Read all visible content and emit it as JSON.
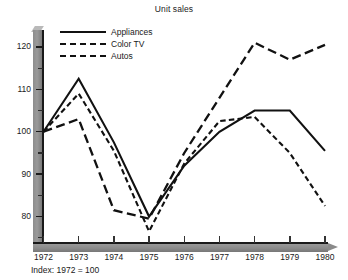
{
  "chart_data": {
    "type": "line",
    "title": "Unit sales",
    "footnote": "Index: 1972 = 100",
    "xlabel": "",
    "ylabel": "",
    "categories": [
      "1972",
      "1973",
      "1974",
      "1975",
      "1976",
      "1977",
      "1978",
      "1979",
      "1980"
    ],
    "x": [
      1972,
      1973,
      1974,
      1975,
      1976,
      1977,
      1978,
      1979,
      1980
    ],
    "ylim": [
      74,
      124
    ],
    "yticks_major": [
      80,
      90,
      100,
      110,
      120
    ],
    "yticks_minor": [
      75,
      85,
      95,
      105,
      115
    ],
    "ytick_labels": [
      "80",
      "90",
      "100",
      "110",
      "120"
    ],
    "grid": false,
    "legend_position": "top-left",
    "series": [
      {
        "name": "Appliances",
        "style": "solid",
        "values": [
          100,
          112.5,
          97.5,
          80,
          92,
          100,
          105,
          105,
          95.5
        ]
      },
      {
        "name": "Color TV",
        "style": "short-dash",
        "values": [
          100,
          109,
          95.5,
          76.5,
          92.5,
          102.5,
          103.5,
          95,
          82.5
        ]
      },
      {
        "name": "Autos",
        "style": "long-dash",
        "values": [
          100,
          103,
          81.5,
          79.5,
          95,
          108,
          121,
          117,
          120.5
        ]
      }
    ]
  },
  "axis": {
    "y_label_80": "80",
    "y_label_90": "90",
    "y_label_100": "100",
    "y_label_110": "110",
    "y_label_120": "120"
  },
  "legend": {
    "items": [
      {
        "label": "Appliances",
        "style": "solid"
      },
      {
        "label": "Color TV",
        "style": "short-dash"
      },
      {
        "label": "Autos",
        "style": "long-dash"
      }
    ]
  }
}
